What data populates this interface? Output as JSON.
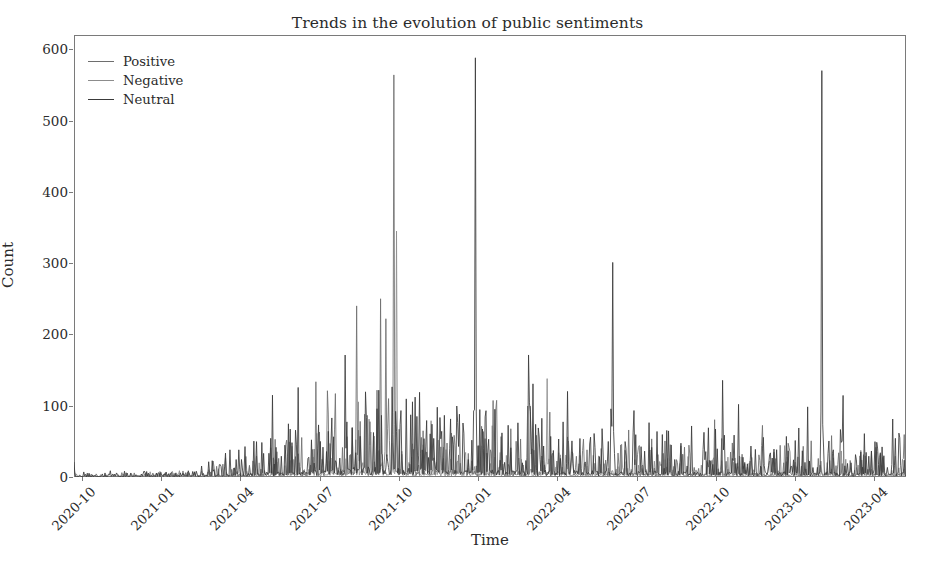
{
  "chart_data": {
    "type": "line",
    "title": "Trends in the evolution of public sentiments",
    "xlabel": "Time",
    "ylabel": "Count",
    "ylim": [
      0,
      620
    ],
    "yticks": [
      0,
      100,
      200,
      300,
      400,
      500,
      600
    ],
    "ytick_labels": [
      "0",
      "100",
      "200",
      "300",
      "400",
      "500",
      "600"
    ],
    "xtick_labels": [
      "2020-10",
      "2021-01",
      "2021-04",
      "2021-07",
      "2021-10",
      "2022-01",
      "2022-04",
      "2022-07",
      "2022-10",
      "2023-01",
      "2023-04"
    ],
    "xlim_months": [
      0,
      31.5
    ],
    "xtick_months": [
      0.3,
      3.3,
      6.3,
      9.3,
      12.3,
      15.3,
      18.3,
      21.3,
      24.3,
      27.3,
      30.3
    ],
    "grid": false,
    "legend_position": "upper left",
    "legend_frame": false,
    "colors": {
      "positive": "#6e6e6e",
      "negative": "#8c8c8c",
      "neutral": "#3a3a3a",
      "axis": "#7a7a7a",
      "text": "#2b2b2b",
      "background": "#ffffff"
    },
    "series": [
      {
        "name": "Positive",
        "color_key": "positive",
        "peak_count": 564,
        "peak_time": "2021-10",
        "notes": "daily counts, near zero until 2021-04, highly spiky afterwards"
      },
      {
        "name": "Negative",
        "color_key": "negative",
        "peak_count": 345,
        "peak_time": "2021-10",
        "notes": "daily counts, generally lowest of the three series"
      },
      {
        "name": "Neutral",
        "color_key": "neutral",
        "peak_count": 588,
        "peak_time": "2022-01",
        "notes": "daily counts, tallest isolated spikes at 2022-01 and 2023-02"
      }
    ],
    "annotated_peaks": [
      {
        "series": "Positive",
        "month": 12.1,
        "value": 564
      },
      {
        "series": "Positive",
        "month": 11.6,
        "value": 250
      },
      {
        "series": "Positive",
        "month": 11.8,
        "value": 222
      },
      {
        "series": "Positive",
        "month": 10.7,
        "value": 240
      },
      {
        "series": "Negative",
        "month": 12.2,
        "value": 345
      },
      {
        "series": "Neutral",
        "month": 15.2,
        "value": 588
      },
      {
        "series": "Neutral",
        "month": 20.4,
        "value": 301
      },
      {
        "series": "Neutral",
        "month": 28.3,
        "value": 570
      },
      {
        "series": "Negative",
        "month": 17.9,
        "value": 138
      },
      {
        "series": "Positive",
        "month": 9.6,
        "value": 121
      },
      {
        "series": "Positive",
        "month": 9.9,
        "value": 117
      }
    ]
  },
  "legend": {
    "items": [
      {
        "label": "Positive",
        "color": "#6e6e6e"
      },
      {
        "label": "Negative",
        "color": "#8c8c8c"
      },
      {
        "label": "Neutral",
        "color": "#3a3a3a"
      }
    ]
  }
}
